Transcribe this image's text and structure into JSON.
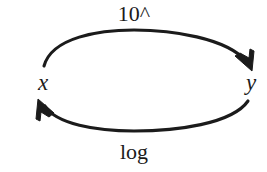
{
  "diagram": {
    "type": "cycle-diagram",
    "background_color": "#ffffff",
    "stroke_color": "#1b1b1b",
    "nodes": [
      {
        "id": "x",
        "label": "x",
        "name": "node-x"
      },
      {
        "id": "y",
        "label": "y",
        "name": "node-y"
      }
    ],
    "edges": [
      {
        "id": "x-to-y",
        "label": "10^",
        "from": "x",
        "to": "y",
        "direction": "left-to-right",
        "position": "top",
        "arrowhead": "filled-triangle"
      },
      {
        "id": "y-to-x",
        "label": "log",
        "from": "y",
        "to": "x",
        "direction": "right-to-left",
        "position": "bottom",
        "arrowhead": "filled-triangle"
      }
    ]
  }
}
